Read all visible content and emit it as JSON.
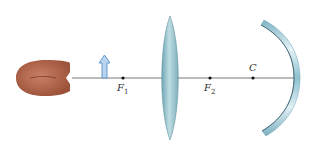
{
  "diagram": {
    "type": "optics-ray-setup",
    "elements": [
      {
        "id": "eye",
        "label": ""
      },
      {
        "id": "object",
        "label": ""
      },
      {
        "id": "lens",
        "label": ""
      },
      {
        "id": "mirror",
        "label": ""
      }
    ],
    "points": {
      "f1": {
        "base": "F",
        "sub": "1"
      },
      "f2": {
        "base": "F",
        "sub": "2"
      },
      "c": {
        "base": "C"
      }
    },
    "colors": {
      "axis": "#555555",
      "object_arrow_fill": "#b8d4ee",
      "object_arrow_stroke": "#5b8fc9",
      "lens": "#8fbcc6",
      "mirror": "#a9cfdb",
      "eye": "#b86a4e"
    }
  }
}
